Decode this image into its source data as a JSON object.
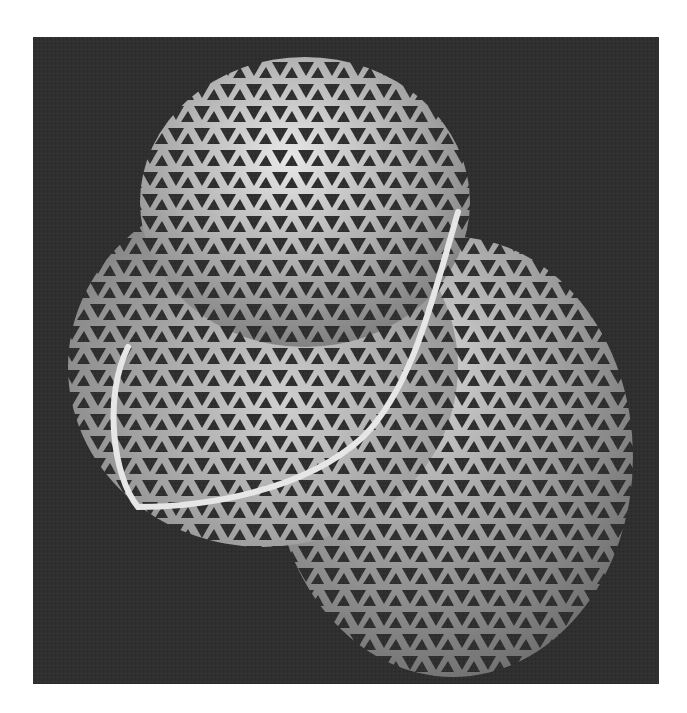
{
  "image": {
    "subject": "3D rendered triangular lattice surface with three lobes and a bright tube curve",
    "background_color": "#2f2f2f",
    "page_color": "#ffffff",
    "lattice_color": "#b8b8b8",
    "tube_color": "#e6e6e6",
    "lobes": [
      {
        "name": "top",
        "cx": 272,
        "cy": 160,
        "rx": 165,
        "ry": 140
      },
      {
        "name": "left",
        "cx": 230,
        "cy": 330,
        "rx": 195,
        "ry": 180
      },
      {
        "name": "right",
        "cx": 420,
        "cy": 420,
        "rx": 180,
        "ry": 220
      }
    ]
  }
}
